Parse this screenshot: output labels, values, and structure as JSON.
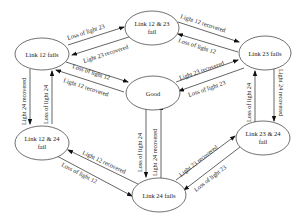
{
  "diagram": {
    "type": "state-transition",
    "nodes": [
      {
        "id": "l12",
        "line1": "Link 12 fails",
        "line2": ""
      },
      {
        "id": "l1223",
        "line1": "Link 12 & 23",
        "line2": "fail"
      },
      {
        "id": "l23",
        "line1": "Link 23 fails",
        "line2": ""
      },
      {
        "id": "good",
        "line1": "Good",
        "line2": ""
      },
      {
        "id": "l1224",
        "line1": "Link 12 & 24",
        "line2": "fail"
      },
      {
        "id": "l2324",
        "line1": "Link 23 & 24",
        "line2": "fail"
      },
      {
        "id": "l24",
        "line1": "Link 24 fails",
        "line2": ""
      }
    ],
    "edges": [
      {
        "from": "l12",
        "to": "l1223",
        "label": "Loss of light 23"
      },
      {
        "from": "l1223",
        "to": "l12",
        "label": "Light 23 recovered"
      },
      {
        "from": "l1223",
        "to": "l23",
        "label": "Light 12 recovered"
      },
      {
        "from": "l23",
        "to": "l1223",
        "label": "Loss of light 12"
      },
      {
        "from": "l12",
        "to": "good",
        "label": "Loss of light 12"
      },
      {
        "from": "good",
        "to": "l12",
        "label": "Light 12 recovered"
      },
      {
        "from": "good",
        "to": "l23",
        "label": "Light 23 recovered"
      },
      {
        "from": "l23",
        "to": "good",
        "label": "Loss of light 23"
      },
      {
        "from": "l12",
        "to": "l1224",
        "label": "Light 24 recovered"
      },
      {
        "from": "l1224",
        "to": "l12",
        "label": "Loss of light 24"
      },
      {
        "from": "l2324",
        "to": "l23",
        "label": "Loss of light 24"
      },
      {
        "from": "l23",
        "to": "l2324",
        "label": "Light 24 recovered"
      },
      {
        "from": "good",
        "to": "l24",
        "label": "Loss of light 24"
      },
      {
        "from": "l24",
        "to": "good",
        "label": "Light 24 recovered"
      },
      {
        "from": "l24",
        "to": "l1224",
        "label": "Light 12 recovered"
      },
      {
        "from": "l1224",
        "to": "l24",
        "label": "Loss of light 12"
      },
      {
        "from": "l24",
        "to": "l2324",
        "label": "Light 23 recovered"
      },
      {
        "from": "l2324",
        "to": "l24",
        "label": "Loss of light 23"
      }
    ]
  }
}
